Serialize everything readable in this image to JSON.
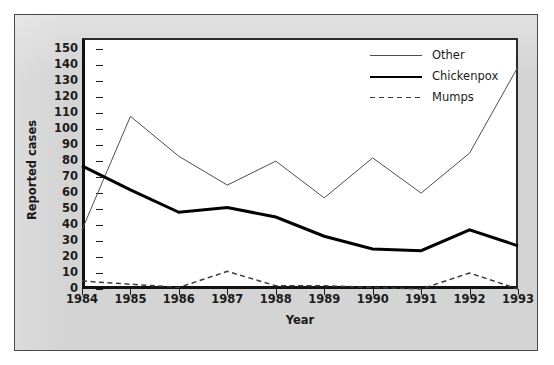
{
  "chart_data": {
    "type": "line",
    "title": "",
    "xlabel": "Year",
    "ylabel": "Reported cases",
    "categories": [
      "1984",
      "1985",
      "1986",
      "1987",
      "1988",
      "1989",
      "1990",
      "1991",
      "1992",
      "1993"
    ],
    "x": [
      1984,
      1985,
      1986,
      1987,
      1988,
      1989,
      1990,
      1991,
      1992,
      1993
    ],
    "xlim": [
      1984,
      1993
    ],
    "ylim": [
      0,
      157
    ],
    "yticks": [
      0,
      10,
      20,
      30,
      40,
      50,
      60,
      70,
      80,
      90,
      100,
      110,
      120,
      130,
      140,
      150
    ],
    "grid": false,
    "legend_position": "top-right",
    "series": [
      {
        "name": "Other",
        "style": "thin-solid",
        "color": "#4f4f4f",
        "values": [
          37,
          108,
          83,
          65,
          80,
          57,
          82,
          60,
          85,
          139
        ]
      },
      {
        "name": "Chickenpox",
        "style": "thick-solid",
        "color": "#000000",
        "values": [
          77,
          62,
          48,
          51,
          45,
          33,
          25,
          24,
          37,
          27
        ]
      },
      {
        "name": "Mumps",
        "style": "dashed",
        "color": "#3b3b3b",
        "values": [
          5,
          3,
          1,
          11,
          2,
          2,
          1,
          0,
          10,
          0
        ]
      }
    ]
  },
  "axes": {
    "y_title": "Reported cases",
    "x_title": "Year",
    "y_tick_labels": [
      "0",
      "10",
      "20",
      "30",
      "40",
      "50",
      "60",
      "70",
      "80",
      "90",
      "100",
      "110",
      "120",
      "130",
      "140",
      "150"
    ],
    "x_tick_labels": [
      "1984",
      "1985",
      "1986",
      "1987",
      "1988",
      "1989",
      "1990",
      "1991",
      "1992",
      "1993"
    ]
  },
  "legend": {
    "items": [
      {
        "label": "Other",
        "style": "thin-solid"
      },
      {
        "label": "Chickenpox",
        "style": "thick-solid"
      },
      {
        "label": "Mumps",
        "style": "dashed"
      }
    ]
  },
  "colors": {
    "plate_background": "#d4d4d4",
    "panel_background": "#ffffff",
    "axis": "#111111",
    "other_line": "#4f4f4f",
    "chickenpox_line": "#000000",
    "mumps_line": "#3b3b3b"
  }
}
